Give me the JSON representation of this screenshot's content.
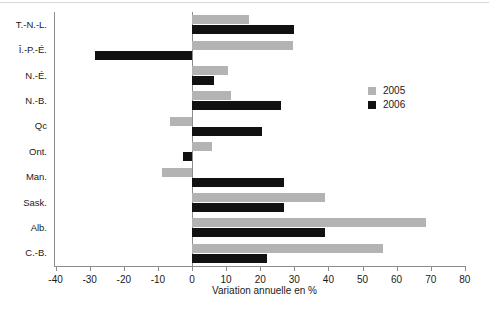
{
  "chart_data": {
    "type": "bar",
    "orientation": "horizontal",
    "title": "",
    "xlabel": "Variation annuelle en %",
    "ylabel": "",
    "xlim": [
      -40,
      80
    ],
    "xticks": [
      -40,
      -30,
      -20,
      -10,
      0,
      10,
      20,
      30,
      40,
      50,
      60,
      70,
      80
    ],
    "xtick_labels": [
      "-40",
      "-30",
      "-20",
      "-10",
      "0",
      "10",
      "20",
      "30",
      "40",
      "50",
      "60",
      "70",
      "80"
    ],
    "grid": false,
    "legend_position": "upper right",
    "categories": [
      "T.-N.-L.",
      "Î.-P.-É.",
      "N.-É.",
      "N.-B.",
      "Qc",
      "Ont.",
      "Man.",
      "Sask.",
      "Alb.",
      "C.-B."
    ],
    "series": [
      {
        "name": "2005",
        "color": "#b3b3b3",
        "values": [
          16.7,
          29.6,
          10.5,
          11.5,
          -6.5,
          6.0,
          -8.8,
          39.0,
          68.5,
          56.0
        ]
      },
      {
        "name": "2006",
        "color": "#111111",
        "values": [
          30.0,
          -28.5,
          6.5,
          26.0,
          20.5,
          -2.5,
          27.0,
          27.0,
          39.0,
          22.0
        ]
      }
    ]
  },
  "legend": {
    "items": [
      {
        "label": "2005",
        "color": "#b3b3b3"
      },
      {
        "label": "2006",
        "color": "#111111"
      }
    ]
  }
}
